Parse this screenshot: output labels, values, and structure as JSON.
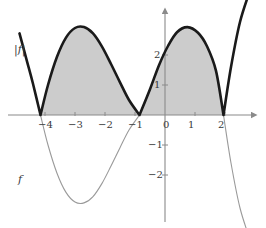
{
  "figure": {
    "background_color": "#ffffff",
    "shade_color": "#cccccc",
    "thick_curve_color": "#1a1a1a",
    "thin_curve_color": "#9a9a9a",
    "axis_color": "#8a8a8a",
    "text_color": "#3a3a3a"
  },
  "axes": {
    "x_axis": {
      "label": "",
      "ticks": [
        {
          "value": -4,
          "label": "−4"
        },
        {
          "value": -3,
          "label": "−3"
        },
        {
          "value": -2,
          "label": "−2"
        },
        {
          "value": -1,
          "label": "−1"
        },
        {
          "value": 0,
          "label": "0"
        },
        {
          "value": 1,
          "label": "1"
        },
        {
          "value": 2,
          "label": "2"
        }
      ],
      "range": [
        -4.85,
        2.85
      ],
      "arrow": "right"
    },
    "y_axis": {
      "label": "",
      "ticks": [
        {
          "value": 2,
          "label": "2"
        },
        {
          "value": 1,
          "label": "1"
        },
        {
          "value": -1,
          "label": "−1"
        },
        {
          "value": -2,
          "label": "−2"
        }
      ],
      "range": [
        -3.4,
        3.2
      ],
      "arrow": "up"
    },
    "grid": false
  },
  "curve_labels": {
    "abs_f": "|f|",
    "f": "f"
  },
  "chart_data": {
    "type": "line",
    "xlabel": "",
    "ylabel": "",
    "xlim": [
      -4.85,
      2.85
    ],
    "ylim": [
      -3.4,
      3.2
    ],
    "grid": false,
    "legend": "inline-curve-labels",
    "annotations": [
      {
        "text": "|f|",
        "x": -4.55,
        "y": 2.0,
        "note": "label for thick absolute-value curve"
      },
      {
        "text": "f",
        "x": -4.6,
        "y": -1.9,
        "note": "label for thin original curve"
      }
    ],
    "shaded_region": {
      "description": "region between the x-axis and |f| over the visible roots",
      "color": "#cccccc",
      "x_from": -4.15,
      "x_to": 1.95
    },
    "roots": [
      -4.15,
      -0.85,
      1.95
    ],
    "extrema": [
      {
        "x": -2.7,
        "y": 2.93,
        "type": "max of |f|"
      },
      {
        "x": 0.75,
        "y": 2.93,
        "type": "max of |f|"
      },
      {
        "x": 0.75,
        "y": -2.93,
        "type": "min of f"
      },
      {
        "x": -2.7,
        "y": -2.93,
        "type": "min of f (outside drawn f)"
      }
    ],
    "series": [
      {
        "name": "f",
        "style": "thin",
        "color": "#9a9a9a",
        "description": "smooth sinusoid-like curve crossing zero at -4.15, -0.85, 1.95",
        "x": [
          -4.85,
          -4.6,
          -4.4,
          -4.15,
          -3.9,
          -3.6,
          -3.3,
          -3.0,
          -2.7,
          -2.4,
          -2.1,
          -1.8,
          -1.5,
          -1.2,
          -0.85,
          -0.5,
          -0.2,
          0.1,
          0.4,
          0.75,
          1.1,
          1.4,
          1.7,
          1.95,
          2.2,
          2.5,
          2.85
        ],
        "y": [
          2.72,
          1.79,
          1.04,
          0.0,
          -1.0,
          -1.94,
          -2.58,
          -2.9,
          -2.93,
          -2.72,
          -2.28,
          -1.7,
          -1.09,
          -0.5,
          0.0,
          0.86,
          1.66,
          2.3,
          2.76,
          2.93,
          2.74,
          2.29,
          1.47,
          0.0,
          -1.6,
          -3.1,
          -4.2
        ]
      },
      {
        "name": "|f|",
        "style": "thick",
        "color": "#1a1a1a",
        "description": "absolute value of f: negative lobes reflected above the x-axis",
        "x": [
          -4.85,
          -4.6,
          -4.4,
          -4.15,
          -3.9,
          -3.6,
          -3.3,
          -3.0,
          -2.7,
          -2.4,
          -2.1,
          -1.8,
          -1.5,
          -1.2,
          -0.85,
          -0.5,
          -0.2,
          0.1,
          0.4,
          0.75,
          1.1,
          1.4,
          1.7,
          1.95,
          2.2,
          2.5,
          2.85
        ],
        "y": [
          2.72,
          1.79,
          1.04,
          0.0,
          1.0,
          1.94,
          2.58,
          2.9,
          2.93,
          2.72,
          2.28,
          1.7,
          1.09,
          0.5,
          0.0,
          0.86,
          1.66,
          2.3,
          2.76,
          2.93,
          2.74,
          2.29,
          1.47,
          0.0,
          1.6,
          3.1,
          4.2
        ]
      }
    ]
  }
}
